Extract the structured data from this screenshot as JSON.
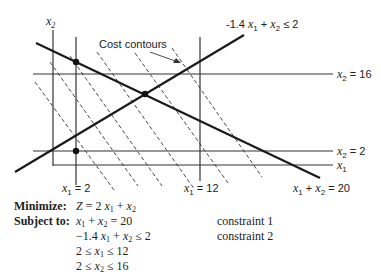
{
  "diagram": {
    "axis_labels": {
      "x2": "x",
      "x2_sub": "2",
      "x1": "x",
      "x1_sub": "1"
    },
    "annotations": {
      "cost_contours": "Cost contours",
      "constraint2_label": "-1.4 x1 + x2 ≤ 2",
      "x2_16": "x2 = 16",
      "x2_2": "x2 = 2",
      "x1_2": "x1 = 2",
      "x1_12": "x1 = 12",
      "constraint1_label": "x1 + x2 = 20"
    },
    "lines": {
      "x2_axis": [
        53,
        30,
        53,
        166
      ],
      "x1_axis": [
        53,
        165,
        333,
        165
      ],
      "x1_eq_2": [
        76,
        37,
        76,
        185
      ],
      "x1_eq_12": [
        200,
        37,
        200,
        181
      ],
      "x2_eq_16": [
        33,
        74,
        333,
        74
      ],
      "x2_eq_2": [
        33,
        151,
        333,
        151
      ],
      "constraint1": [
        36,
        43,
        320,
        178
      ],
      "constraint2": [
        15,
        172,
        244,
        35
      ]
    },
    "contours": [
      [
        35,
        82,
        114,
        190
      ],
      [
        50,
        62,
        138,
        186
      ],
      [
        70,
        56,
        162,
        186
      ],
      [
        97,
        52,
        195,
        190
      ],
      [
        135,
        53,
        228,
        183
      ],
      [
        172,
        48,
        262,
        177
      ]
    ],
    "points": [
      [
        76,
        62
      ],
      [
        145,
        94
      ],
      [
        76,
        151
      ]
    ]
  },
  "problem": {
    "minimize_key": "Minimize:",
    "objective": "Z = 2 x1 + x2",
    "subject_key": "Subject to:",
    "constraints": [
      {
        "expr": "x1 + x2 = 20",
        "note": "constraint 1"
      },
      {
        "expr": "−1.4 x1 + x2 ≤ 2",
        "note": "constraint 2"
      },
      {
        "expr": "2 ≤ x1 ≤ 12",
        "note": ""
      },
      {
        "expr": "2 ≤ x2 ≤ 16",
        "note": ""
      }
    ]
  }
}
